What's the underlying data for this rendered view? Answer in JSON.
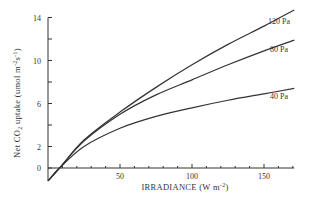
{
  "chart_data": {
    "type": "line",
    "title": "",
    "xlabel": "IRRADIANCE  (W m-2)",
    "ylabel": "Net CO2 uptake (umol m-2 s-1)",
    "xlim": [
      0,
      172
    ],
    "ylim": [
      -1.2,
      14
    ],
    "x_ticks": [
      0,
      50,
      100,
      150
    ],
    "x_tick_labels": [
      "50",
      "100",
      "150"
    ],
    "y_ticks": [
      0,
      2,
      4,
      6,
      8,
      10,
      12,
      14
    ],
    "y_tick_labels": [
      "0",
      "2",
      "6",
      "10",
      "14"
    ],
    "grid": false,
    "legend": "inline labels at right end of curves",
    "x": [
      0,
      8,
      25,
      50,
      75,
      100,
      125,
      150,
      171
    ],
    "series": [
      {
        "name": "120 Pa",
        "values": [
          -1.2,
          0,
          2.6,
          5.2,
          7.5,
          9.6,
          11.5,
          13.2,
          14.7
        ]
      },
      {
        "name": "80 Pa",
        "values": [
          -1.2,
          0,
          2.5,
          5.0,
          6.8,
          8.2,
          9.6,
          10.9,
          11.9
        ]
      },
      {
        "name": "40 Pa",
        "values": [
          -1.2,
          0,
          2.0,
          3.7,
          4.8,
          5.6,
          6.3,
          6.9,
          7.4
        ]
      }
    ]
  },
  "axes": {
    "y_title_main": "Net CO",
    "y_title_sub": "2",
    "y_title_rest": "  uptake  (umol m",
    "y_title_exp1": "-2",
    "y_title_s": "s",
    "y_title_exp2": "-1",
    "y_title_close": ")",
    "x_title_main": "IRRADIANCE   (W m",
    "x_title_exp": "-2",
    "x_title_close": ")"
  }
}
